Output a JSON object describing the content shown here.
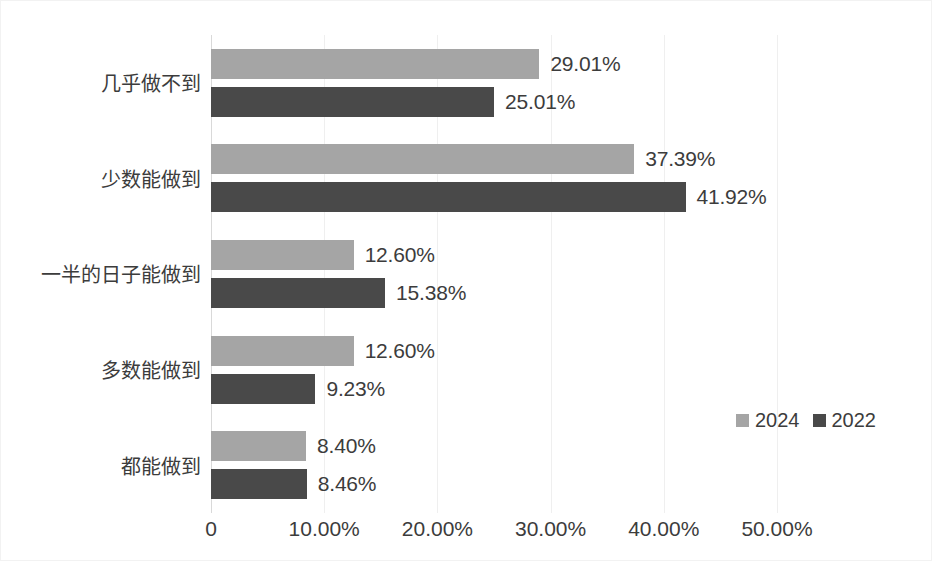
{
  "chart_data": {
    "type": "bar",
    "orientation": "horizontal",
    "title": "",
    "subtitle": "",
    "xlabel": "",
    "ylabel": "",
    "xlim": [
      0,
      50
    ],
    "xticks": [
      0,
      10,
      20,
      30,
      40,
      50
    ],
    "xtick_labels": [
      "0",
      "10.00%",
      "20.00%",
      "30.00%",
      "40.00%",
      "50.00%"
    ],
    "grid": true,
    "grid_axis": "x",
    "legend_position": "right-inside",
    "categories": [
      "几乎做不到",
      "少数能做到",
      "一半的日子能做到",
      "多数能做到",
      "都能做到"
    ],
    "series": [
      {
        "name": "2024",
        "color": "#a5a5a5",
        "values": [
          29.01,
          37.39,
          12.6,
          12.6,
          8.4
        ],
        "value_labels": [
          "29.01%",
          "37.39%",
          "12.60%",
          "12.60%",
          "8.40%"
        ]
      },
      {
        "name": "2022",
        "color": "#494949",
        "values": [
          25.01,
          41.92,
          15.38,
          9.23,
          8.46
        ],
        "value_labels": [
          "25.01%",
          "41.92%",
          "15.38%",
          "9.23%",
          "8.46%"
        ]
      }
    ]
  },
  "legend": {
    "items": [
      {
        "label": "2024",
        "color": "#a5a5a5"
      },
      {
        "label": "2022",
        "color": "#494949"
      }
    ]
  },
  "axis": {
    "x_tick_labels": [
      "0",
      "10.00%",
      "20.00%",
      "30.00%",
      "40.00%",
      "50.00%"
    ],
    "category_labels": [
      "几乎做不到",
      "少数能做到",
      "一半的日子能做到",
      "多数能做到",
      "都能做到"
    ]
  },
  "colors": {
    "series_2024": "#a5a5a5",
    "series_2022": "#494949",
    "gridline": "#efefef",
    "axis": "#d9d9d9",
    "text": "#3c3c3c",
    "background": "#ffffff"
  }
}
